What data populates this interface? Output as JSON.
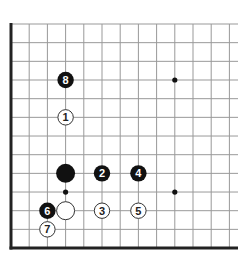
{
  "diagram": {
    "type": "go-board-corner",
    "grid": {
      "origin_x": 11,
      "origin_y": 24,
      "col_spacing": 18.2,
      "row_spacing": 18.67,
      "columns": 13,
      "rows": 13,
      "line_color": "#999999",
      "border_color": "#222222",
      "right_extent": 238,
      "bottom_border_row": 12,
      "left_border": true,
      "bottom_border": true
    },
    "star_points": [
      {
        "col": 3,
        "row": 3
      },
      {
        "col": 9,
        "row": 3
      },
      {
        "col": 3,
        "row": 9
      },
      {
        "col": 9,
        "row": 9
      }
    ],
    "stones": [
      {
        "color": "black",
        "col": 3,
        "row": 3,
        "label": "8",
        "size": "normal"
      },
      {
        "color": "white",
        "col": 3,
        "row": 5,
        "label": "1",
        "size": "normal"
      },
      {
        "color": "black",
        "col": 3,
        "row": 8,
        "label": "",
        "size": "large"
      },
      {
        "color": "black",
        "col": 5,
        "row": 8,
        "label": "2",
        "size": "normal"
      },
      {
        "color": "black",
        "col": 7,
        "row": 8,
        "label": "4",
        "size": "normal"
      },
      {
        "color": "black",
        "col": 2,
        "row": 10,
        "label": "6",
        "size": "normal"
      },
      {
        "color": "white",
        "col": 3,
        "row": 10,
        "label": "",
        "size": "large"
      },
      {
        "color": "white",
        "col": 5,
        "row": 10,
        "label": "3",
        "size": "normal"
      },
      {
        "color": "white",
        "col": 7,
        "row": 10,
        "label": "5",
        "size": "normal"
      },
      {
        "color": "white",
        "col": 2,
        "row": 11,
        "label": "7",
        "size": "normal"
      }
    ],
    "colors": {
      "black_stone": "#111111",
      "white_stone": "#ffffff",
      "white_stone_edge": "#333333",
      "black_label": "#ffffff",
      "white_label": "#222222",
      "star": "#111111"
    }
  }
}
